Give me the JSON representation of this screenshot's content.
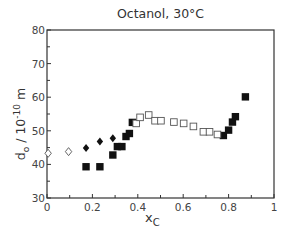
{
  "chart_data": {
    "type": "scatter",
    "title": "Octanol, 30°C",
    "xlabel": "x_C",
    "ylabel": "d0 / 10^-10 m",
    "xlim": [
      0,
      1
    ],
    "ylim": [
      30,
      80
    ],
    "x_ticks": [
      0,
      0.2,
      0.4,
      0.6,
      0.8,
      1
    ],
    "x_tick_labels": [
      "0",
      "0.2",
      "0.4",
      "0.6",
      "0.8",
      "1"
    ],
    "y_ticks": [
      30,
      40,
      50,
      60,
      70,
      80
    ],
    "y_tick_labels": [
      "30",
      "40",
      "50",
      "60",
      "70",
      "80"
    ],
    "grid": false,
    "legend": null,
    "series": [
      {
        "name": "open diamonds",
        "marker": "diamond-open",
        "points": [
          [
            0.005,
            43.3
          ],
          [
            0.095,
            43.8
          ]
        ]
      },
      {
        "name": "filled diamonds",
        "marker": "diamond-filled",
        "points": [
          [
            0.172,
            44.9
          ],
          [
            0.233,
            46.8
          ],
          [
            0.29,
            47.8
          ]
        ]
      },
      {
        "name": "filled squares",
        "marker": "square-filled",
        "points": [
          [
            0.172,
            39.3
          ],
          [
            0.233,
            39.3
          ],
          [
            0.29,
            42.8
          ],
          [
            0.31,
            45.3
          ],
          [
            0.33,
            45.3
          ],
          [
            0.348,
            48.3
          ],
          [
            0.363,
            49.2
          ],
          [
            0.376,
            52.5
          ],
          [
            0.777,
            48.6
          ],
          [
            0.8,
            50.2
          ],
          [
            0.817,
            52.6
          ],
          [
            0.83,
            54.2
          ],
          [
            0.874,
            60.1
          ]
        ]
      },
      {
        "name": "open squares",
        "marker": "square-open",
        "points": [
          [
            0.393,
            52.2
          ],
          [
            0.41,
            54.0
          ],
          [
            0.448,
            54.7
          ],
          [
            0.476,
            53.0
          ],
          [
            0.502,
            53.0
          ],
          [
            0.559,
            52.6
          ],
          [
            0.602,
            52.2
          ],
          [
            0.645,
            51.3
          ],
          [
            0.689,
            49.7
          ],
          [
            0.716,
            49.7
          ],
          [
            0.751,
            48.9
          ]
        ]
      }
    ]
  },
  "labels": {
    "title": "Octanol, 30°C",
    "ylabel_main": "d",
    "ylabel_sub": "o",
    "ylabel_rest": " / 10",
    "ylabel_sup": "-10",
    "ylabel_unit": " m",
    "xlabel_main": "x",
    "xlabel_sub": "C"
  }
}
